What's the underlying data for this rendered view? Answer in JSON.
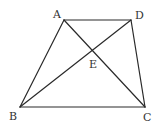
{
  "diagram": {
    "type": "geometry",
    "points": {
      "A": {
        "x": 64,
        "y": 20,
        "label": "A",
        "lx": 53,
        "ly": 18
      },
      "D": {
        "x": 131,
        "y": 20,
        "label": "D",
        "lx": 135,
        "ly": 19
      },
      "B": {
        "x": 20,
        "y": 107,
        "label": "B",
        "lx": 9,
        "ly": 120
      },
      "C": {
        "x": 145,
        "y": 107,
        "label": "C",
        "lx": 143,
        "ly": 121
      },
      "E": {
        "x": 92,
        "y": 50,
        "label": "E",
        "lx": 89,
        "ly": 68
      }
    },
    "segments": [
      "AD",
      "DC",
      "CB",
      "BA",
      "AC",
      "BD"
    ],
    "colors": {
      "line": "#2a2a2a",
      "label": "#333333",
      "background": "#ffffff"
    }
  }
}
